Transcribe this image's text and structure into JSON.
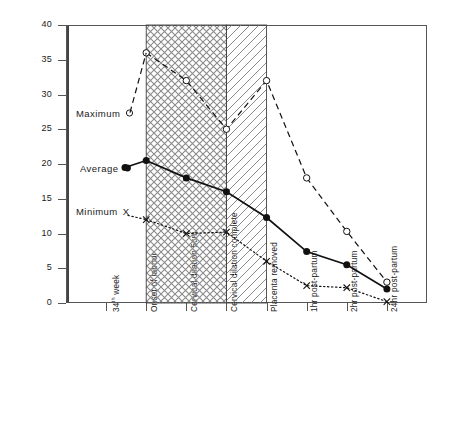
{
  "chart_data": {
    "type": "line",
    "title": "",
    "xlabel": "",
    "ylabel": "μg progesterone/100ml plasma",
    "ylim": [
      0,
      40
    ],
    "yticks": [
      0,
      5,
      10,
      15,
      20,
      25,
      30,
      35,
      40
    ],
    "grid": false,
    "legend_position": "inside-left",
    "categories": [
      "34th week",
      "Onset of labour",
      "Cervical dilation 5cm",
      "Cervical dilation complete",
      "Placenta removed",
      "1hr post-partum",
      "2hr post-partum",
      "24hr post-partum"
    ],
    "series": [
      {
        "name": "Maximum",
        "marker": "open-circle",
        "line": "dashed",
        "values": [
          null,
          36,
          32,
          25,
          32,
          18,
          10.3,
          3
        ]
      },
      {
        "name": "Average",
        "marker": "filled-circle",
        "line": "solid",
        "values": [
          null,
          20.5,
          18,
          16,
          12.3,
          7.4,
          5.5,
          2
        ]
      },
      {
        "name": "Minimum",
        "marker": "x",
        "line": "dotted",
        "values": [
          null,
          12,
          10,
          10.2,
          6,
          2.5,
          2.2,
          0.2
        ]
      }
    ],
    "shaded_regions": [
      {
        "name": "first-stage",
        "from_category": "Onset of labour",
        "to_category": "Cervical dilation complete",
        "pattern": "cross-hatch"
      },
      {
        "name": "second-stage",
        "from_category": "Cervical dilation complete",
        "to_category": "Placenta removed",
        "pattern": "diagonal-hatch"
      }
    ]
  },
  "axis": {
    "y_title": "μg progesterone/100ml plasma",
    "y_tick_labels": [
      "40",
      "35",
      "30",
      "25",
      "20",
      "15",
      "10",
      "5",
      "0"
    ],
    "x_tick_labels": [
      "34th week",
      "Onset of labour",
      "Cervical dilation 5cm",
      "Cervical dilation complete",
      "Placenta removed",
      "1hr post-partum",
      "2hr post-partum",
      "24hr post-partum"
    ],
    "x_tick_label_0_main": "34",
    "x_tick_label_0_sup": "th",
    "x_tick_label_0_tail": " week"
  },
  "legend": {
    "maximum": "Maximum",
    "average": "Average",
    "minimum": "Minimum",
    "minimum_marker": "X"
  },
  "colors": {
    "ink": "#1a1a1a",
    "axis": "#555555",
    "hatch": "#8a8a8a"
  }
}
